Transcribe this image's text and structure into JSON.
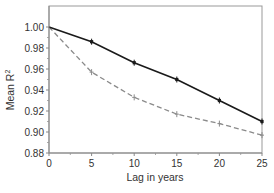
{
  "chart_data": {
    "type": "line",
    "title": "",
    "xlabel": "Lag in years",
    "ylabel": "Mean R²",
    "ylabel_main": "Mean R",
    "ylabel_sup": "2",
    "xlim": [
      0,
      25
    ],
    "ylim": [
      0.88,
      1.01
    ],
    "x_ticks": [
      0,
      5,
      10,
      15,
      20,
      25
    ],
    "x_tick_labels": [
      "0",
      "5",
      "10",
      "15",
      "20",
      "25"
    ],
    "y_ticks": [
      0.88,
      0.9,
      0.92,
      0.94,
      0.96,
      0.98,
      1.0
    ],
    "y_tick_labels": [
      "0.88",
      "0.90",
      "0.92",
      "0.94",
      "0.96",
      "0.98",
      "1.00"
    ],
    "grid": false,
    "legend": null,
    "x": [
      0,
      5,
      10,
      15,
      20,
      25
    ],
    "series": [
      {
        "name": "solid",
        "style": "solid",
        "color": "#1a1a1a",
        "values": [
          1.0,
          0.986,
          0.966,
          0.95,
          0.93,
          0.91
        ]
      },
      {
        "name": "dashed",
        "style": "dashed",
        "color": "#8a8a8a",
        "values": [
          1.0,
          0.957,
          0.933,
          0.917,
          0.908,
          0.897
        ]
      }
    ]
  }
}
